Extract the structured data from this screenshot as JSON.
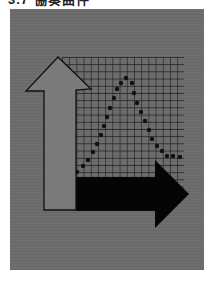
{
  "caption": {
    "text": "3.7  協奏曲件"
  },
  "illustration": {
    "description": "Up arrow and right arrow over a grid with a dotted bell curve",
    "colors": {
      "background": "#6e6e6e",
      "grid_line": "#1a1a1a",
      "up_arrow_fill": "#7a7a7a",
      "up_arrow_stroke": "#111111",
      "right_arrow_fill": "#050505",
      "dots": "#111111"
    },
    "curve_points": [
      [
        77,
        172
      ],
      [
        83,
        166
      ],
      [
        88,
        160
      ],
      [
        93,
        152
      ],
      [
        97,
        144
      ],
      [
        101,
        135
      ],
      [
        104,
        126
      ],
      [
        107,
        117
      ],
      [
        110,
        108
      ],
      [
        114,
        98
      ],
      [
        117,
        89
      ],
      [
        121,
        83
      ],
      [
        126,
        78
      ],
      [
        132,
        83
      ],
      [
        134,
        93
      ],
      [
        137,
        103
      ],
      [
        141,
        112
      ],
      [
        145,
        121
      ],
      [
        149,
        130
      ],
      [
        152,
        139
      ],
      [
        157,
        146
      ],
      [
        162,
        151
      ],
      [
        167,
        156
      ],
      [
        173,
        156
      ],
      [
        180,
        157
      ]
    ]
  }
}
